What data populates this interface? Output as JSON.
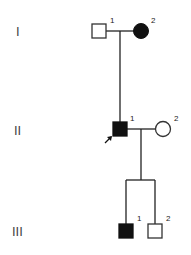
{
  "generations": [
    {
      "label": "I",
      "y": 31
    },
    {
      "label": "II",
      "y": 130
    },
    {
      "label": "III",
      "y": 231
    }
  ],
  "individuals": [
    {
      "id": "I-1",
      "number": "1",
      "sex": "male",
      "affected": false,
      "x": 99,
      "y": 31
    },
    {
      "id": "I-2",
      "number": "2",
      "sex": "female",
      "affected": true,
      "x": 141,
      "y": 31
    },
    {
      "id": "II-1",
      "number": "1",
      "sex": "male",
      "affected": true,
      "proband": true,
      "x": 120,
      "y": 130
    },
    {
      "id": "II-2",
      "number": "2",
      "sex": "female",
      "affected": false,
      "x": 163,
      "y": 130
    },
    {
      "id": "III-1",
      "number": "1",
      "sex": "male",
      "affected": true,
      "x": 126,
      "y": 231
    },
    {
      "id": "III-2",
      "number": "2",
      "sex": "male",
      "affected": false,
      "x": 155,
      "y": 231
    }
  ],
  "colors": {
    "line": "#222222",
    "affected": "#111111",
    "unaffected": "#ffffff"
  }
}
